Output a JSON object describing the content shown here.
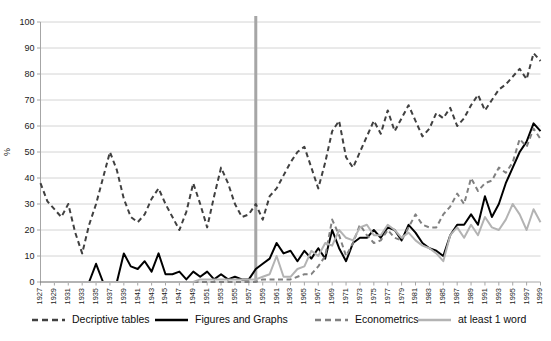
{
  "chart_data": {
    "type": "line",
    "title": "",
    "xlabel": "",
    "ylabel": "%",
    "ylim": [
      0,
      100
    ],
    "ytick_step": 10,
    "yticks": [
      0,
      10,
      20,
      30,
      40,
      50,
      60,
      70,
      80,
      90,
      100
    ],
    "grid": true,
    "legend_position": "bottom",
    "xlim": [
      1927,
      1999
    ],
    "x": [
      1927,
      1928,
      1929,
      1930,
      1931,
      1932,
      1933,
      1934,
      1935,
      1936,
      1937,
      1938,
      1939,
      1940,
      1941,
      1942,
      1943,
      1944,
      1945,
      1946,
      1947,
      1948,
      1949,
      1950,
      1951,
      1952,
      1953,
      1954,
      1955,
      1956,
      1957,
      1958,
      1959,
      1960,
      1961,
      1962,
      1963,
      1964,
      1965,
      1966,
      1967,
      1968,
      1969,
      1970,
      1971,
      1972,
      1973,
      1974,
      1975,
      1976,
      1977,
      1978,
      1979,
      1980,
      1981,
      1982,
      1983,
      1984,
      1985,
      1986,
      1987,
      1988,
      1989,
      1990,
      1991,
      1992,
      1993,
      1994,
      1995,
      1996,
      1997,
      1998,
      1999
    ],
    "xticks": [
      1927,
      1929,
      1931,
      1933,
      1935,
      1937,
      1939,
      1941,
      1943,
      1945,
      1947,
      1949,
      1951,
      1953,
      1955,
      1957,
      1959,
      1961,
      1963,
      1965,
      1967,
      1969,
      1971,
      1973,
      1975,
      1977,
      1979,
      1981,
      1983,
      1985,
      1987,
      1989,
      1991,
      1993,
      1995,
      1997,
      1999
    ],
    "xtick_labels": [
      "1927",
      "1929",
      "1931",
      "1933",
      "1935",
      "1937",
      "1939",
      "1941",
      "1943",
      "1945",
      "1947",
      "1949",
      "1951",
      "1953",
      "1955",
      "1957",
      "1959",
      "1961",
      "1963",
      "1965",
      "1967",
      "1969",
      "1971",
      "1973",
      "1975",
      "1977",
      "1979",
      "1981",
      "1983",
      "1985",
      "1987",
      "1989",
      "1991",
      "1993",
      "1995",
      "1997",
      "1999"
    ],
    "annotations": [
      {
        "name": "vertical-marker-1958",
        "type": "vline",
        "x": 1958,
        "color": "#a6a6a6"
      }
    ],
    "series": [
      {
        "name": "Decriptive tables",
        "color": "#404040",
        "style": "dashed",
        "width": 2,
        "values": [
          38,
          31,
          28,
          25,
          30,
          19,
          11,
          22,
          30,
          40,
          50,
          43,
          32,
          25,
          23,
          26,
          32,
          36,
          30,
          25,
          20,
          27,
          38,
          30,
          21,
          33,
          44,
          38,
          30,
          25,
          26,
          30,
          24,
          33,
          36,
          41,
          46,
          50,
          52,
          44,
          36,
          46,
          58,
          62,
          48,
          44,
          50,
          56,
          62,
          57,
          66,
          58,
          63,
          68,
          62,
          56,
          59,
          65,
          63,
          67,
          60,
          63,
          68,
          72,
          66,
          70,
          74,
          76,
          79,
          82,
          78,
          88,
          85
        ]
      },
      {
        "name": "Figures and Graphs",
        "color": "#000000",
        "style": "solid",
        "width": 2,
        "values": [
          0,
          0,
          0,
          0,
          0,
          0,
          0,
          0,
          7,
          0,
          0,
          0,
          11,
          6,
          5,
          8,
          4,
          11,
          3,
          3,
          4,
          1,
          4,
          2,
          4,
          1,
          3,
          1,
          2,
          1,
          1,
          5,
          7,
          9,
          15,
          11,
          12,
          8,
          12,
          9,
          13,
          9,
          20,
          13,
          8,
          15,
          17,
          17,
          20,
          17,
          21,
          20,
          16,
          22,
          19,
          15,
          13,
          12,
          10,
          18,
          22,
          22,
          26,
          22,
          33,
          25,
          30,
          38,
          44,
          50,
          54,
          61,
          58
        ]
      },
      {
        "name": "Econometrics",
        "color": "#808080",
        "style": "dashed",
        "width": 2,
        "values": [
          0,
          0,
          0,
          0,
          0,
          0,
          0,
          0,
          0,
          0,
          0,
          0,
          0,
          0,
          0,
          0,
          0,
          0,
          0,
          0,
          0,
          0,
          0,
          0,
          0,
          0,
          0,
          0,
          0,
          0,
          0,
          0,
          1,
          1,
          1,
          1,
          1,
          2,
          3,
          3,
          6,
          10,
          24,
          18,
          10,
          15,
          22,
          18,
          15,
          16,
          20,
          17,
          16,
          21,
          26,
          22,
          21,
          21,
          26,
          29,
          34,
          30,
          40,
          35,
          38,
          39,
          44,
          42,
          46,
          55,
          52,
          59,
          55
        ]
      },
      {
        "name": "at least 1 word",
        "color": "#b3b3b3",
        "style": "solid",
        "width": 2,
        "values": [
          0,
          0,
          0,
          0,
          0,
          0,
          0,
          0,
          0,
          0,
          0,
          0,
          0,
          0,
          0,
          0,
          0,
          0,
          0,
          0,
          0,
          0,
          0,
          1,
          1,
          1,
          1,
          1,
          1,
          1,
          1,
          1,
          2,
          3,
          10,
          2,
          2,
          5,
          6,
          12,
          10,
          15,
          14,
          20,
          17,
          16,
          21,
          22,
          18,
          18,
          22,
          20,
          17,
          19,
          16,
          14,
          13,
          11,
          8,
          18,
          21,
          17,
          22,
          18,
          25,
          21,
          20,
          24,
          30,
          26,
          20,
          28,
          23
        ]
      }
    ]
  },
  "legend": {
    "items": [
      {
        "label": "Decriptive tables",
        "color": "#404040",
        "style": "dashed"
      },
      {
        "label": "Figures and Graphs",
        "color": "#000000",
        "style": "solid"
      },
      {
        "label": "Econometrics",
        "color": "#808080",
        "style": "dashed"
      },
      {
        "label": "at least 1 word",
        "color": "#b3b3b3",
        "style": "solid"
      }
    ]
  }
}
